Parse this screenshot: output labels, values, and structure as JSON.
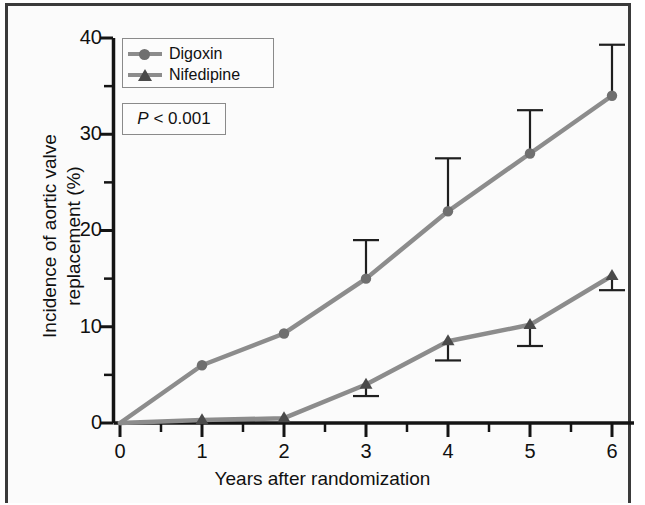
{
  "figure": {
    "background_color": "#fbfbfb",
    "frame_color": "#3a3a3a"
  },
  "legend": {
    "series": [
      {
        "label": "Digoxin",
        "marker": "circle-marker-icon",
        "color": "#8c8c8c"
      },
      {
        "label": "Nifedipine",
        "marker": "triangle-marker-icon",
        "color": "#4a4a4a"
      }
    ],
    "pvalue": {
      "italic": "P",
      "rest": " < 0.001"
    }
  },
  "chart_data": {
    "type": "line",
    "title": "",
    "xlabel": "Years after randomization",
    "ylabel": "Incidence of aortic valve\nreplacement (%)",
    "ylabel_line1": "Incidence of aortic valve",
    "ylabel_line2": "replacement (%)",
    "x": [
      0,
      1,
      2,
      3,
      4,
      5,
      6
    ],
    "xlim": [
      0,
      6.3
    ],
    "ylim": [
      0,
      40
    ],
    "xticks": [
      0,
      1,
      2,
      3,
      4,
      5,
      6
    ],
    "xtick_labels": [
      "0",
      "1",
      "2",
      "3",
      "4",
      "5",
      "6"
    ],
    "xminor_ticks": [
      0.5,
      1.5,
      2.5,
      3.5,
      4.5,
      5.5
    ],
    "yticks": [
      0,
      10,
      20,
      30,
      40
    ],
    "ytick_labels": [
      "0",
      "10",
      "20",
      "30",
      "40"
    ],
    "yminor_ticks": [
      5,
      15,
      25,
      35
    ],
    "grid": false,
    "legend_position": "upper left",
    "annotations": [
      "P < 0.001"
    ],
    "series": [
      {
        "name": "Digoxin",
        "color": "#8c8c8c",
        "marker": "circle",
        "marker_color": "#6f6f6f",
        "values": [
          0,
          6.0,
          9.3,
          15.0,
          22.0,
          28.0,
          34.0
        ],
        "errorbar_direction": "up",
        "errorbar_upper": [
          null,
          null,
          null,
          19.0,
          27.5,
          32.5,
          39.3
        ]
      },
      {
        "name": "Nifedipine",
        "color": "#8c8c8c",
        "marker": "triangle",
        "marker_color": "#4a4a4a",
        "values": [
          0,
          0.3,
          0.5,
          4.0,
          8.5,
          10.2,
          15.3
        ],
        "errorbar_direction": "down",
        "errorbar_lower": [
          null,
          null,
          null,
          2.8,
          6.5,
          8.0,
          13.8
        ]
      }
    ]
  }
}
